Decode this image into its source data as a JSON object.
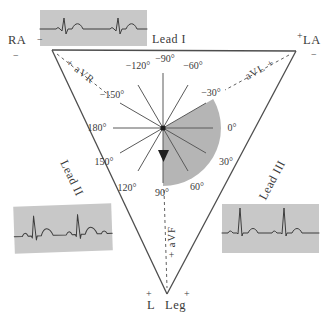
{
  "figure": {
    "type": "einthoven-triangle-ecg-lead-diagram",
    "leads": {
      "lead1": "Lead I",
      "lead2": "Lead II",
      "lead3": "Lead III"
    },
    "augmented": {
      "avr": "+ aVR",
      "avl": "aVL +",
      "avf": "+ aVF"
    },
    "corners": {
      "ra": "RA",
      "la": "LA",
      "ll_l": "L",
      "ll_leg": "Leg",
      "minus": "−",
      "plus": "+"
    },
    "axis_angles": {
      "a0": "0°",
      "a30": "30°",
      "a60": "60°",
      "a90": "90°",
      "a120": "120°",
      "a150": "150°",
      "a180": "180°",
      "am30": "−30°",
      "am60": "−60°",
      "am90": "−90°",
      "am120": "−120°",
      "am150": "−150°"
    },
    "shaded_sector": {
      "from": "−30°",
      "to": "90°",
      "meaning": "normal mean electrical axis range"
    },
    "colors": {
      "strip_background": "#c8c8c8",
      "waveform_line": "#3d3d3d",
      "triangle_line": "#4d4d4d",
      "axis_line": "#5a5a5a",
      "sector_fill": "#b5b5b5",
      "text": "#3a3a3a",
      "background": "#ffffff"
    }
  }
}
